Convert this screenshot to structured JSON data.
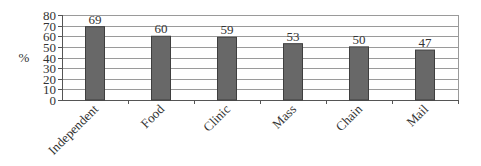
{
  "chart_data": {
    "type": "bar",
    "title": "",
    "xlabel": "",
    "ylabel": "%",
    "categories": [
      "Independent",
      "Food",
      "Clinic",
      "Mass",
      "Chain",
      "Mail"
    ],
    "values": [
      69,
      60,
      59,
      53,
      50,
      47
    ],
    "ylim": [
      0,
      80
    ],
    "yticks": [
      0,
      10,
      20,
      30,
      40,
      50,
      60,
      70,
      80
    ],
    "grid": true,
    "legend": null,
    "data_labels": true,
    "bar_color": "#686868",
    "bar_border_color": "#3f3f3f",
    "grid_color": "#9a9a9a"
  }
}
